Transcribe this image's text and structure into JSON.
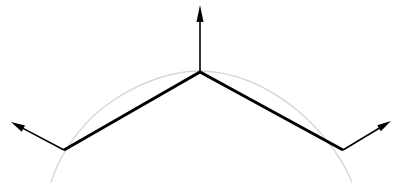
{
  "canvas": {
    "width": 401,
    "height": 183,
    "background": "#ffffff"
  },
  "figure": {
    "type": "vector-diagram"
  },
  "colors": {
    "segment_stroke": "#000000",
    "arrow_stroke": "#000000",
    "arc_stroke": "#d8d8d8",
    "background": "#ffffff"
  },
  "strokes": {
    "segment_width": 3.0,
    "arrow_shaft_width": 1.6,
    "arc_width": 1.4
  },
  "chart_data": {
    "type": "line",
    "xlabel": "",
    "ylabel": "",
    "xlim": [
      0,
      401
    ],
    "ylim": [
      183,
      0
    ],
    "grid": false,
    "legend": null,
    "series": [
      {
        "name": "polyline-surface",
        "color": "#000000",
        "width": 3.0,
        "points": [
          [
            64,
            150
          ],
          [
            200,
            72
          ],
          [
            343,
            150
          ]
        ]
      },
      {
        "name": "reference-arc",
        "color": "#d8d8d8",
        "width": 1.4,
        "kind": "arc",
        "points": [
          [
            50,
            183
          ],
          [
            64,
            150
          ],
          [
            110,
            104
          ],
          [
            160,
            79
          ],
          [
            200,
            71
          ],
          [
            245,
            76
          ],
          [
            295,
            100
          ],
          [
            335,
            141
          ],
          [
            343,
            150
          ],
          [
            355,
            183
          ]
        ]
      }
    ]
  },
  "vertices": [
    {
      "name": "left-vertex",
      "x": 64,
      "y": 150
    },
    {
      "name": "apex-vertex",
      "x": 200,
      "y": 72
    },
    {
      "name": "right-vertex",
      "x": 343,
      "y": 150
    }
  ],
  "arrows": [
    {
      "name": "left-normal-arrow",
      "label": "left normal vector",
      "from": {
        "x": 64,
        "y": 150
      },
      "to": {
        "x": 11,
        "y": 122
      },
      "head_length": 14,
      "head_width": 7
    },
    {
      "name": "apex-normal-arrow",
      "label": "apex normal vector",
      "from": {
        "x": 200,
        "y": 72
      },
      "to": {
        "x": 200,
        "y": 5
      },
      "head_length": 17,
      "head_width": 7
    },
    {
      "name": "right-normal-arrow",
      "label": "right normal vector",
      "from": {
        "x": 343,
        "y": 150
      },
      "to": {
        "x": 391,
        "y": 121
      },
      "head_length": 14,
      "head_width": 7
    }
  ],
  "segments": [
    {
      "name": "left-segment",
      "from": {
        "x": 64,
        "y": 150
      },
      "to": {
        "x": 200,
        "y": 72
      }
    },
    {
      "name": "right-segment",
      "from": {
        "x": 200,
        "y": 72
      },
      "to": {
        "x": 343,
        "y": 150
      }
    }
  ],
  "arc": {
    "name": "reference-curve",
    "path": "M 51,183 C 56,163 76,128 104,107 C 133,85 168,71 200,71 C 233,71 268,86 297,110 C 324,132 345,163 352,183",
    "color": "#d8d8d8"
  }
}
